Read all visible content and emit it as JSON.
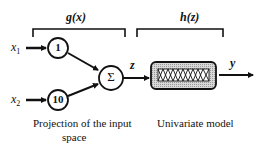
{
  "diagram": {
    "left_block": {
      "function_label": "g(x)",
      "caption_line1": "Projection of the input",
      "caption_line2": "space",
      "inputs": [
        {
          "name_base": "x",
          "name_sub": "1",
          "weight": "1"
        },
        {
          "name_base": "x",
          "name_sub": "2",
          "weight": "10"
        }
      ],
      "sum_symbol": "Σ"
    },
    "intermediate_variable": "z",
    "right_block": {
      "function_label": "h(z)",
      "caption": "Univariate model"
    },
    "output_variable": "y"
  }
}
